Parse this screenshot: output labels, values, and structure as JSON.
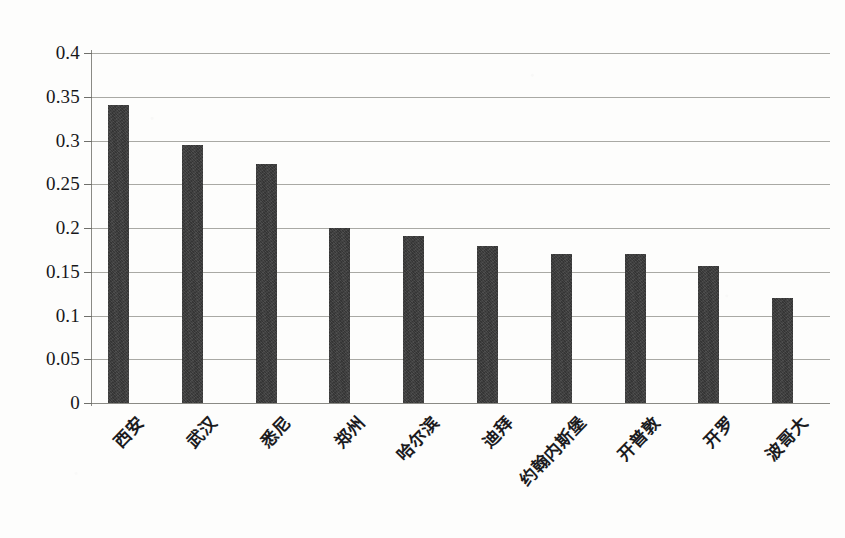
{
  "chart_data": {
    "type": "bar",
    "title": "",
    "subtitle": "",
    "xlabel": "",
    "ylabel": "",
    "ylim": [
      0,
      0.4
    ],
    "ytick_labels": [
      "0",
      "0.05",
      "0.1",
      "0.15",
      "0.2",
      "0.25",
      "0.3",
      "0.35",
      "0.4"
    ],
    "ytick_values": [
      0,
      0.05,
      0.1,
      0.15,
      0.2,
      0.25,
      0.3,
      0.35,
      0.4
    ],
    "grid": true,
    "legend": false,
    "legend_position": "none",
    "bar_color": "#3b3b3b",
    "axis_color": "#8a8a85",
    "grid_color": "#9a9a94",
    "categories": [
      "西安",
      "武汉",
      "悉尼",
      "郑州",
      "哈尔滨",
      "迪拜",
      "约翰内斯堡",
      "开普敦",
      "开罗",
      "波哥大"
    ],
    "values": [
      0.341,
      0.295,
      0.273,
      0.2,
      0.191,
      0.179,
      0.17,
      0.17,
      0.157,
      0.12
    ],
    "series": [
      {
        "name": "",
        "values": [
          0.341,
          0.295,
          0.273,
          0.2,
          0.191,
          0.179,
          0.17,
          0.17,
          0.157,
          0.12
        ]
      }
    ]
  }
}
